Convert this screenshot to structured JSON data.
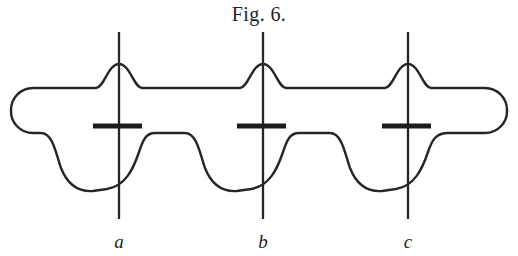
{
  "figure": {
    "caption": "Fig. 6.",
    "background_color": "#ffffff",
    "ink_color": "#262626",
    "plate_color": "#1c1c1c",
    "canvas": {
      "width": 518,
      "height": 256
    }
  },
  "tube": {
    "name": "discharge-tube-outline",
    "left_cap_x": 11,
    "right_cap_x": 507,
    "body_top_y": 88,
    "body_bottom_y": 133,
    "bulge_bottom_y": 192,
    "stroke_width": 2.4
  },
  "electrodes": [
    {
      "label": "a",
      "axis_x": 119,
      "wire_top_y": 32,
      "wire_bottom_y": 219,
      "plate_y": 126,
      "plate_x1": 93,
      "plate_x2": 142,
      "bump_peak_y": 64,
      "bulge_center_x": 119,
      "bulge_half_width": 58,
      "label_x": 119,
      "label_y": 248
    },
    {
      "label": "b",
      "axis_x": 263,
      "wire_top_y": 32,
      "wire_bottom_y": 219,
      "plate_y": 126,
      "plate_x1": 237,
      "plate_x2": 286,
      "bump_peak_y": 64,
      "bulge_center_x": 263,
      "bulge_half_width": 58,
      "label_x": 263,
      "label_y": 248
    },
    {
      "label": "c",
      "axis_x": 408,
      "wire_top_y": 32,
      "wire_bottom_y": 219,
      "plate_y": 126,
      "plate_x1": 382,
      "plate_x2": 431,
      "bump_peak_y": 64,
      "bulge_center_x": 408,
      "bulge_half_width": 58,
      "label_x": 408,
      "label_y": 248
    }
  ],
  "geometry": {
    "top_path": "M 11 110 A 22 22 0 0 1 33 88 L 96 88 C 104 88 108 64 119 64 C 130 64 134 88 142 88 L 240 88 C 248 88 252 64 263 64 C 274 64 278 88 286 88 L 385 88 C 393 88 397 64 408 64 C 419 64 423 88 431 88 L 485 88 A 22 22 0 0 1 507 110",
    "bottom_path": "M 507 110 A 22 22 0 0 1 485 133 L 448 133 C 436 133 432 140 428 152 C 422 170 414 186 396 189 L 382 191 C 368 192 357 186 350 168 C 345 154 342 133 330 133 L 299 133 C 290 133 287 140 283 152 C 277 170 269 186 251 189 L 237 191 C 223 192 212 186 205 168 C 200 154 197 133 185 133 L 155 133 C 146 133 143 140 139 152 C 133 170 125 186 107 189 L 93 191 C 79 192 68 186 61 168 C 56 154 53 133 41 133 L 33 133 A 22 22 0 0 1 11 110"
  }
}
